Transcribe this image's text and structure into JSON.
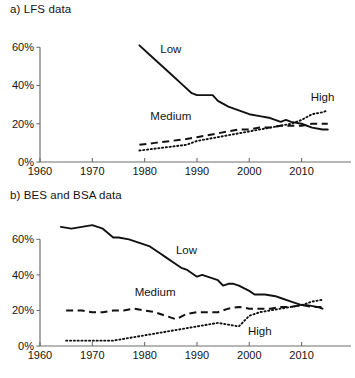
{
  "figure": {
    "background": "#ffffff",
    "ink_color": "#111111",
    "axis_color": "#6e6e6e"
  },
  "panels": [
    {
      "id": "a",
      "title": "a) LFS data"
    },
    {
      "id": "b",
      "title": "b) BES and BSA data"
    }
  ],
  "chart_data": [
    {
      "type": "line",
      "title": "a) LFS data",
      "xlabel": "",
      "ylabel": "",
      "xlim": [
        1960,
        2016
      ],
      "ylim": [
        0,
        68
      ],
      "xticks": [
        1960,
        1970,
        1980,
        1990,
        2000,
        2010
      ],
      "xticklabels": [
        "1960",
        "1970",
        "1980",
        "1990",
        "2000",
        "2010"
      ],
      "yticks": [
        0,
        20,
        40,
        60
      ],
      "yticklabels": [
        "0%",
        "20%",
        "40%",
        "60%"
      ],
      "grid": false,
      "legend": "inline-annotations",
      "annotations": [
        {
          "text": "Low",
          "x": 1985,
          "y": 57
        },
        {
          "text": "Medium",
          "x": 1985,
          "y": 22
        },
        {
          "text": "High",
          "x": 2014,
          "y": 32
        }
      ],
      "series": [
        {
          "name": "Low",
          "style": "solid",
          "x": [
            1979,
            1981,
            1983,
            1985,
            1987,
            1989,
            1990,
            1992,
            1993,
            1994,
            1996,
            1998,
            2000,
            2002,
            2004,
            2006,
            2007,
            2008,
            2010,
            2012,
            2014,
            2015
          ],
          "values": [
            61,
            56,
            51,
            46,
            41,
            36,
            35,
            35,
            35,
            32,
            29,
            27,
            25,
            24,
            23,
            21,
            22,
            21,
            20,
            18,
            17,
            17
          ]
        },
        {
          "name": "Medium",
          "style": "dashed",
          "x": [
            1979,
            1982,
            1985,
            1988,
            1990,
            1992,
            1994,
            1996,
            1998,
            2000,
            2002,
            2004,
            2006,
            2008,
            2010,
            2012,
            2014,
            2015
          ],
          "values": [
            9,
            10,
            11,
            12,
            13,
            14,
            15,
            16,
            17,
            17,
            18,
            18,
            19,
            19,
            19,
            20,
            20,
            20
          ]
        },
        {
          "name": "High",
          "style": "dotted",
          "x": [
            1979,
            1982,
            1985,
            1988,
            1990,
            1992,
            1994,
            1996,
            1998,
            2000,
            2002,
            2004,
            2006,
            2008,
            2010,
            2012,
            2014,
            2015
          ],
          "values": [
            6,
            7,
            8,
            9,
            11,
            12,
            13,
            14,
            15,
            16,
            17,
            18,
            19,
            20,
            22,
            25,
            26,
            27
          ]
        }
      ]
    },
    {
      "type": "line",
      "title": "b) BES and BSA data",
      "xlabel": "",
      "ylabel": "",
      "xlim": [
        1960,
        2016
      ],
      "ylim": [
        0,
        72
      ],
      "xticks": [
        1960,
        1970,
        1980,
        1990,
        2000,
        2010
      ],
      "xticklabels": [
        "1960",
        "1970",
        "1980",
        "1990",
        "2000",
        "2010"
      ],
      "yticks": [
        0,
        20,
        40,
        60
      ],
      "yticklabels": [
        "0%",
        "20%",
        "40%",
        "60%"
      ],
      "grid": false,
      "legend": "inline-annotations",
      "annotations": [
        {
          "text": "Low",
          "x": 1988,
          "y": 52
        },
        {
          "text": "Medium",
          "x": 1982,
          "y": 28
        },
        {
          "text": "High",
          "x": 2002,
          "y": 6
        }
      ],
      "series": [
        {
          "name": "Low",
          "style": "solid",
          "x": [
            1964,
            1966,
            1968,
            1970,
            1972,
            1974,
            1975,
            1977,
            1979,
            1981,
            1983,
            1984,
            1986,
            1987,
            1988,
            1990,
            1991,
            1992,
            1994,
            1995,
            1996,
            1997,
            1998,
            2000,
            2001,
            2003,
            2005,
            2006,
            2008,
            2010,
            2011,
            2013,
            2014
          ],
          "values": [
            67,
            66,
            67,
            68,
            66,
            61,
            61,
            60,
            58,
            56,
            52,
            50,
            46,
            44,
            43,
            39,
            40,
            39,
            37,
            34,
            35,
            35,
            34,
            31,
            29,
            29,
            28,
            27,
            25,
            23,
            23,
            22,
            21
          ]
        },
        {
          "name": "Medium",
          "style": "dashed",
          "x": [
            1965,
            1968,
            1970,
            1972,
            1974,
            1976,
            1978,
            1980,
            1982,
            1984,
            1986,
            1988,
            1990,
            1992,
            1994,
            1996,
            1998,
            2000,
            2002,
            2004,
            2006,
            2008,
            2010,
            2012,
            2014
          ],
          "values": [
            20,
            20,
            19,
            19,
            20,
            20,
            21,
            20,
            19,
            17,
            15,
            18,
            19,
            19,
            19,
            21,
            22,
            21,
            21,
            21,
            22,
            22,
            23,
            22,
            22
          ]
        },
        {
          "name": "High",
          "style": "dotted",
          "x": [
            1965,
            1968,
            1970,
            1972,
            1974,
            1976,
            1978,
            1980,
            1982,
            1984,
            1986,
            1988,
            1990,
            1992,
            1994,
            1996,
            1998,
            1999,
            2000,
            2002,
            2004,
            2006,
            2008,
            2010,
            2012,
            2014
          ],
          "values": [
            3,
            3,
            3,
            3,
            3,
            4,
            5,
            6,
            7,
            8,
            9,
            10,
            11,
            12,
            13,
            12,
            11,
            14,
            17,
            19,
            20,
            21,
            22,
            23,
            25,
            26
          ]
        }
      ]
    }
  ]
}
